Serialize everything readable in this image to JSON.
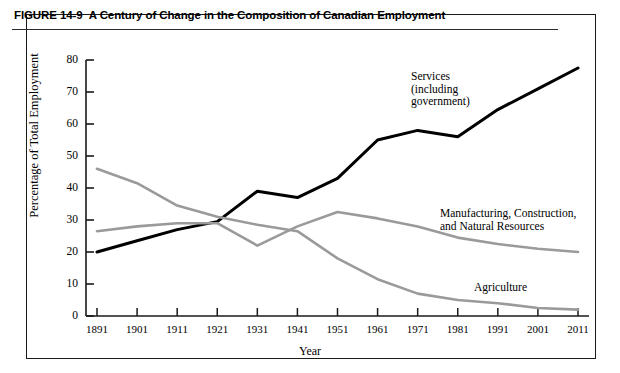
{
  "figure": {
    "number": "FIGURE 14-9",
    "title": "A Century of Change in the Composition of Canadian Employment"
  },
  "annotations": {
    "services": "Services\n(including\ngovernment)",
    "manufacturing": "Manufacturing, Construction,\nand Natural Resources",
    "agriculture": "Agriculture"
  },
  "colors": {
    "services_line": "#000000",
    "manufacturing_line": "#9a9a9a",
    "agriculture_line": "#9a9a9a",
    "axis": "#1a1a1a",
    "panel_border": "#1a1a1a",
    "background": "#ffffff"
  },
  "chart_data": {
    "type": "line",
    "title": "A Century of Change in the Composition of Canadian Employment",
    "xlabel": "Year",
    "ylabel": "Percentage of Total Employment",
    "x": [
      1891,
      1901,
      1911,
      1921,
      1931,
      1941,
      1951,
      1961,
      1971,
      1981,
      1991,
      2001,
      2011
    ],
    "categories": [
      "1891",
      "1901",
      "1911",
      "1921",
      "1931",
      "1941",
      "1951",
      "1961",
      "1971",
      "1981",
      "1991",
      "2001",
      "2011"
    ],
    "xlim": [
      1891,
      2011
    ],
    "ylim": [
      0,
      80
    ],
    "yticks": [
      0,
      10,
      20,
      30,
      40,
      50,
      60,
      70,
      80
    ],
    "ytick_labels": [
      "0",
      "10",
      "20",
      "30",
      "40",
      "50",
      "60",
      "70",
      "80"
    ],
    "grid": false,
    "legend": "inline-annotations",
    "series": [
      {
        "name": "Services (including government)",
        "color": "#000000",
        "values": [
          20,
          23.5,
          27,
          29.5,
          39,
          37,
          43,
          55,
          58,
          56,
          64.5,
          71,
          77.5
        ]
      },
      {
        "name": "Manufacturing, Construction, and Natural Resources",
        "color": "#9a9a9a",
        "values": [
          26.5,
          28,
          29,
          29,
          22,
          28,
          32.5,
          30.5,
          28,
          24.5,
          22.5,
          21,
          20
        ]
      },
      {
        "name": "Agriculture",
        "color": "#9a9a9a",
        "values": [
          46,
          41.5,
          34.5,
          31,
          28.5,
          26.5,
          18,
          11.5,
          7,
          5,
          4,
          2.5,
          2
        ]
      }
    ]
  }
}
